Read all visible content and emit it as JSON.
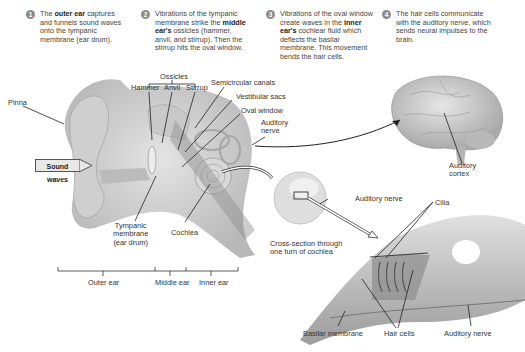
{
  "steps": [
    {
      "num": "1",
      "pre": "The ",
      "bold": "outer ear",
      "post": " captures and funnels sound waves onto the tympanic membrane (ear drum)."
    },
    {
      "num": "2",
      "pre": "Vibrations of the tympanic membrane strike the ",
      "bold": "middle ear's",
      "post": " ossicles (hammer, anvil, and stirrup). Then the stirrup hits the oval window."
    },
    {
      "num": "3",
      "pre": "Vibrations of the oval window create waves in the ",
      "bold": "inner ear's",
      "post": " cochlear fluid which deflects the basilar membrane. This movement bends the hair cells."
    },
    {
      "num": "4",
      "pre": "The hair cells communicate with the auditory nerve, which sends neural impulses to the brain.",
      "bold": "",
      "post": ""
    }
  ],
  "labels": {
    "pinna": "Pinna",
    "ossicles": "Ossicles",
    "hammer": "Hammer",
    "anvil": "Anvil",
    "stirrup": "Stirrup",
    "semicircular_canals": "Semicircular canals",
    "vestibular_sacs": "Vestibular sacs",
    "oval_window": "Oval window",
    "auditory_nerve_1a": "Auditory",
    "auditory_nerve_1b": "nerve",
    "sound_waves": "Sound waves",
    "tympanic_1": "Tympanic",
    "tympanic_2": "membrane",
    "tympanic_3": "(ear drum)",
    "cochlea": "Cochlea",
    "auditory_cortex_1": "Auditory",
    "auditory_cortex_2": "cortex",
    "auditory_nerve_2": "Auditory nerve",
    "cross_section_1": "Cross-section through",
    "cross_section_2": "one turn of cochlea",
    "cilia": "Cilia",
    "basilar_membrane": "Basilar membrane",
    "hair_cells": "Hair cells",
    "auditory_nerve_3": "Auditory nerve"
  },
  "regions": {
    "outer_ear": "Outer ear",
    "middle_ear": "Middle ear",
    "inner_ear": "Inner ear"
  }
}
